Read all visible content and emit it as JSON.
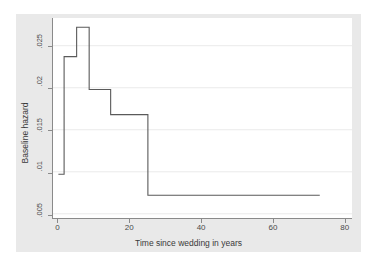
{
  "chart_data": {
    "type": "line",
    "subtype": "step-function",
    "title": "",
    "xlabel": "Time since wedding in years",
    "ylabel": "Baseline hazard",
    "xlim": [
      -1.5,
      82
    ],
    "ylim": [
      0.0045,
      0.0283
    ],
    "xticks": [
      0,
      20,
      40,
      60,
      80
    ],
    "xticklabels": [
      "0",
      "20",
      "40",
      "60",
      "80"
    ],
    "yticks": [
      0.005,
      0.01,
      0.015,
      0.02,
      0.025
    ],
    "yticklabels": [
      ".005",
      ".01",
      ".015",
      ".02",
      ".025"
    ],
    "grid": "horizontal",
    "legend": "none",
    "line_color": "#5a5a5a",
    "plot_background": "#ffffff",
    "figure_background": "#e9e9e9",
    "steps": [
      {
        "x_start": 0.0,
        "x_end": 1.6,
        "value": 0.0097
      },
      {
        "x_start": 1.6,
        "x_end": 5.1,
        "value": 0.0237
      },
      {
        "x_start": 5.1,
        "x_end": 8.6,
        "value": 0.0272
      },
      {
        "x_start": 8.6,
        "x_end": 14.6,
        "value": 0.0198
      },
      {
        "x_start": 14.6,
        "x_end": 25.0,
        "value": 0.0168
      },
      {
        "x_start": 25.0,
        "x_end": 73.0,
        "value": 0.0072
      }
    ],
    "x": [
      0,
      1.6,
      1.6,
      5.1,
      5.1,
      8.6,
      8.6,
      14.6,
      14.6,
      25.0,
      25.0,
      73.0
    ],
    "y": [
      0.0097,
      0.0097,
      0.0237,
      0.0237,
      0.0272,
      0.0272,
      0.0198,
      0.0198,
      0.0168,
      0.0168,
      0.0072,
      0.0072
    ]
  }
}
